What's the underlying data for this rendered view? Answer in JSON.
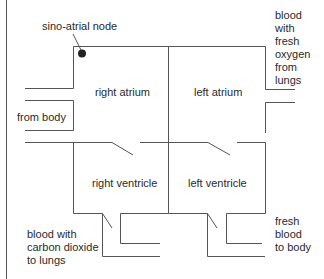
{
  "diagram": {
    "labels": {
      "sa_node": "sino-atrial node",
      "right_atrium": "right atrium",
      "left_atrium": "left atrium",
      "right_ventricle": "right ventricle",
      "left_ventricle": "left ventricle",
      "from_body": "from body",
      "from_lungs_1": "blood",
      "from_lungs_2": "with",
      "from_lungs_3": "fresh",
      "from_lungs_4": "oxygen",
      "from_lungs_5": "from",
      "from_lungs_6": "lungs",
      "to_lungs_1": "blood with",
      "to_lungs_2": "carbon dioxide",
      "to_lungs_3": "to lungs",
      "to_body_1": "fresh",
      "to_body_2": "blood",
      "to_body_3": "to body"
    },
    "colors": {
      "line": "#555555",
      "node": "#222222",
      "text": "#2a2a2a"
    }
  }
}
